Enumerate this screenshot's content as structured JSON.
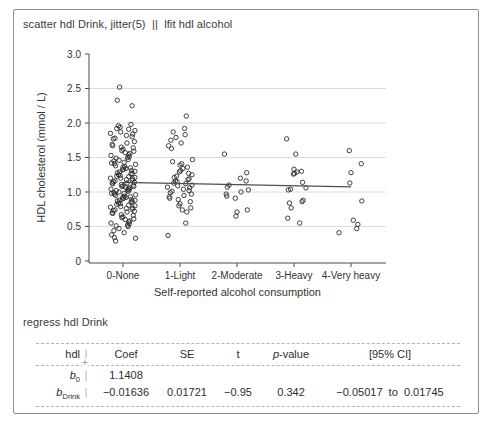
{
  "window": {
    "bg": "#ffffff",
    "border_color": "#8f8f8f"
  },
  "command_top": "scatter hdl Drink, jitter(5)  ||  lfit hdl alcohol",
  "command_bottom": "regress hdl Drink",
  "chart_data": {
    "type": "scatter",
    "title": "",
    "xlabel": "Self-reported alcohol consumption",
    "ylabel": "HDL cholesterol (mmol / L)",
    "categories": [
      "0-None",
      "1-Light",
      "2-Moderate",
      "3-Heavy",
      "4-Very heavy"
    ],
    "x_positions": [
      0,
      1,
      2,
      3,
      4
    ],
    "ylim": [
      0,
      3
    ],
    "yticks": [
      0,
      0.5,
      1,
      1.5,
      2,
      2.5,
      3
    ],
    "ytick_labels": [
      "0",
      "0.5",
      "1.0",
      "1.5",
      "2.0",
      "2.5",
      "3.0"
    ],
    "gridlines": [
      0.5,
      1,
      1.5,
      2,
      2.5
    ],
    "grid_color": "#dcdcdc",
    "axis_color": "#4a4a4a",
    "marker_color": "#2b2b2b",
    "fit_line": {
      "label": "lfit hdl alcohol",
      "x_start": 0,
      "y_start": 1.1408,
      "x_end": 4,
      "y_end": 1.075,
      "color": "#4d4d4d"
    },
    "jitter_cycle": [
      -0.06,
      0.1,
      -0.14,
      0.18,
      -0.21,
      0.02,
      0.13,
      -0.1,
      0.21,
      -0.17,
      0.0,
      0.11,
      -0.2,
      0.05,
      0.16,
      -0.04,
      0.2,
      -0.02,
      0.08,
      -0.15,
      0.01,
      0.14,
      -0.22,
      0.07,
      0.19,
      -0.12,
      0.22,
      -0.01,
      -0.08,
      0.17,
      -0.19,
      0.04,
      0.09,
      -0.13,
      0.15,
      -0.05,
      0.06,
      -0.18,
      0.12,
      -0.07,
      0.03,
      0.21,
      -0.11,
      0.16,
      -0.03,
      0.1,
      -0.16,
      0.0
    ],
    "groups": [
      {
        "label": "0-None",
        "x": 0,
        "values": [
          2.52,
          2.33,
          2.25,
          1.98,
          1.96,
          1.94,
          1.92,
          1.91,
          1.89,
          1.87,
          1.85,
          1.84,
          1.82,
          1.8,
          1.78,
          1.77,
          1.73,
          1.71,
          1.69,
          1.67,
          1.65,
          1.64,
          1.62,
          1.6,
          1.59,
          1.57,
          1.56,
          1.54,
          1.53,
          1.51,
          1.5,
          1.49,
          1.47,
          1.46,
          1.45,
          1.43,
          1.42,
          1.41,
          1.4,
          1.38,
          1.37,
          1.36,
          1.35,
          1.34,
          1.33,
          1.32,
          1.31,
          1.3,
          1.29,
          1.28,
          1.27,
          1.26,
          1.25,
          1.24,
          1.23,
          1.22,
          1.21,
          1.2,
          1.2,
          1.19,
          1.18,
          1.17,
          1.16,
          1.15,
          1.14,
          1.13,
          1.13,
          1.12,
          1.11,
          1.1,
          1.09,
          1.08,
          1.08,
          1.07,
          1.06,
          1.05,
          1.04,
          1.03,
          1.03,
          1.02,
          1.01,
          1.0,
          0.99,
          0.98,
          0.98,
          0.97,
          0.96,
          0.95,
          0.94,
          0.93,
          0.93,
          0.92,
          0.91,
          0.9,
          0.89,
          0.88,
          0.88,
          0.87,
          0.86,
          0.85,
          0.84,
          0.83,
          0.82,
          0.81,
          0.8,
          0.79,
          0.78,
          0.77,
          0.76,
          0.75,
          0.74,
          0.73,
          0.72,
          0.71,
          0.7,
          0.69,
          0.67,
          0.66,
          0.64,
          0.63,
          0.61,
          0.6,
          0.58,
          0.57,
          0.55,
          0.54,
          0.52,
          0.51,
          0.5,
          0.47,
          0.44,
          0.41,
          0.38,
          0.34,
          0.33,
          0.29
        ]
      },
      {
        "label": "1-Light",
        "x": 1,
        "values": [
          2.1,
          1.92,
          1.87,
          1.83,
          1.79,
          1.75,
          1.71,
          1.67,
          1.63,
          1.47,
          1.44,
          1.41,
          1.39,
          1.36,
          1.34,
          1.31,
          1.29,
          1.27,
          1.25,
          1.23,
          1.21,
          1.19,
          1.18,
          1.16,
          1.15,
          1.13,
          1.12,
          1.1,
          1.09,
          1.07,
          1.06,
          1.04,
          1.02,
          1.01,
          0.99,
          0.97,
          0.95,
          0.93,
          0.91,
          0.89,
          0.86,
          0.83,
          0.8,
          0.77,
          0.74,
          0.71,
          0.55,
          0.37
        ]
      },
      {
        "label": "2-Moderate",
        "x": 2,
        "values": [
          1.55,
          1.28,
          1.2,
          1.16,
          1.1,
          1.07,
          1.03,
          1.0,
          0.97,
          0.94,
          0.91,
          0.74,
          0.71,
          0.65
        ]
      },
      {
        "label": "3-Heavy",
        "x": 3,
        "values": [
          1.77,
          1.55,
          1.33,
          1.3,
          1.29,
          1.27,
          1.26,
          1.14,
          1.06,
          1.04,
          1.03,
          0.88,
          0.86,
          0.84,
          0.77,
          0.62,
          0.55
        ]
      },
      {
        "label": "4-Very heavy",
        "x": 4,
        "values": [
          1.6,
          1.41,
          1.28,
          1.13,
          0.87,
          0.59,
          0.53,
          0.47,
          0.41
        ]
      }
    ]
  },
  "table": {
    "sep": "|",
    "cross": "+",
    "headers": {
      "var": "hdl",
      "coef": "Coef",
      "se": "SE",
      "t": "t",
      "p_prefix": "p",
      "p_suffix": "-value",
      "ci": "[95% CI]"
    },
    "rows": [
      {
        "var_base": "b",
        "var_sub": "0",
        "coef": "1.1408",
        "se": "",
        "t": "",
        "p": "",
        "ci": ""
      },
      {
        "var_base": "b",
        "var_sub": "Drink",
        "coef": "−0.01636",
        "se": "0.01721",
        "t": "−0.95",
        "p": "0.342",
        "ci": "−0.05017  to  0.01745"
      }
    ]
  }
}
